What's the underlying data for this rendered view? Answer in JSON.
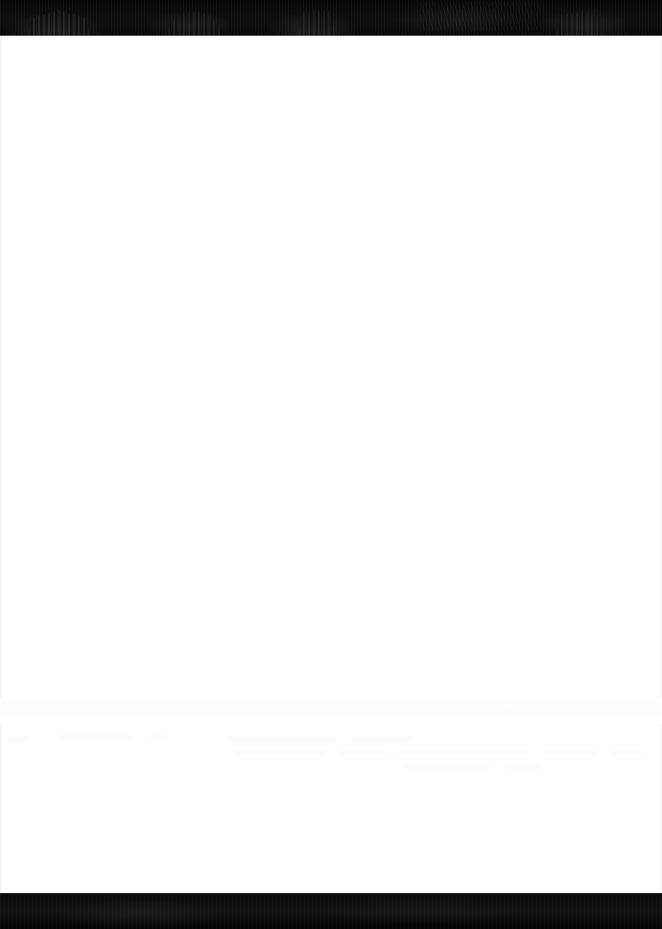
{
  "page": {
    "width": 662,
    "height": 929,
    "background_color": "#ffffff"
  },
  "header_banner": {
    "name": "header-banner",
    "height_px": 36,
    "background_color": "#090909",
    "content_text": "",
    "silhouettes": [
      {
        "name": "columned-temple-silhouette",
        "position": "left"
      },
      {
        "name": "arched-form-silhouette",
        "position": "left-center"
      },
      {
        "name": "domed-structure-silhouette",
        "position": "center"
      },
      {
        "name": "faint-texture-cluster",
        "position": "right-center"
      },
      {
        "name": "angular-block-silhouette",
        "position": "right"
      }
    ]
  },
  "body": {
    "name": "document-body",
    "background_color": "#ffffff",
    "content_text": "",
    "faded_traces": [
      {
        "top_px": 736,
        "left_px": 8,
        "width_px": 22
      },
      {
        "top_px": 735,
        "left_px": 58,
        "width_px": 74
      },
      {
        "top_px": 735,
        "left_px": 150,
        "width_px": 18
      },
      {
        "top_px": 736,
        "left_px": 228,
        "width_px": 108
      },
      {
        "top_px": 736,
        "left_px": 352,
        "width_px": 62
      },
      {
        "top_px": 750,
        "left_px": 234,
        "width_px": 92
      },
      {
        "top_px": 750,
        "left_px": 340,
        "width_px": 46
      },
      {
        "top_px": 750,
        "left_px": 398,
        "width_px": 130
      },
      {
        "top_px": 750,
        "left_px": 544,
        "width_px": 52
      },
      {
        "top_px": 750,
        "left_px": 612,
        "width_px": 30
      },
      {
        "top_px": 764,
        "left_px": 404,
        "width_px": 86
      },
      {
        "top_px": 764,
        "left_px": 504,
        "width_px": 38
      }
    ]
  },
  "footer_banner": {
    "name": "footer-banner",
    "height_px": 36,
    "background_color": "#080808",
    "content_text": ""
  },
  "colors": {
    "page_background": "#ffffff",
    "banner_dark": "#090909",
    "footer_dark": "#080808",
    "banner_edge": "#8e8e93",
    "silhouette_highlight": "#2e2e2e"
  }
}
